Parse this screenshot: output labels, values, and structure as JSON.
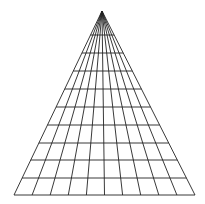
{
  "figure": {
    "type": "perspective-grid",
    "background": "#ffffff",
    "stroke": "#222222",
    "apex": [
      102,
      11
    ],
    "base_y": 195,
    "base_left_x": 14,
    "base_right_x": 195,
    "columns": 10,
    "horizontal_lines_y": [
      35,
      53,
      71,
      89,
      107,
      125,
      143,
      160,
      178,
      195
    ]
  }
}
